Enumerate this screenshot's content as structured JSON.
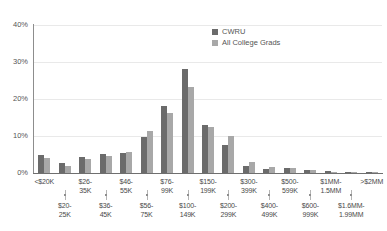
{
  "chart_data": {
    "type": "bar",
    "title": "",
    "subtitle": "",
    "xlabel": "",
    "ylabel": "",
    "ylim": [
      0,
      40
    ],
    "yticks": [
      0,
      10,
      20,
      30,
      40
    ],
    "ytick_labels": [
      "0%",
      "10%",
      "20%",
      "30%",
      "40%"
    ],
    "grid": true,
    "legend_position": "top-right",
    "value_unit": "%",
    "categories": [
      "<$20K",
      "$20-25K",
      "$26-35K",
      "$36-45K",
      "$46-55K",
      "$56-75K",
      "$76-99K",
      "$100-149K",
      "$150-199K",
      "$200-299K",
      "$300-399K",
      "$400-499K",
      "$500-599K",
      "$600-999K",
      "$1MM-1.5MM",
      "$1.6MM-1.99MM",
      ">$2MM"
    ],
    "series": [
      {
        "name": "CWRU",
        "color": "#6b6b6b",
        "values": [
          5.0,
          2.6,
          4.3,
          5.2,
          5.3,
          9.8,
          18.1,
          28.0,
          13.0,
          7.6,
          2.0,
          1.1,
          1.4,
          0.7,
          0.5,
          0.2,
          0.2
        ]
      },
      {
        "name": "All College Grads",
        "color": "#a8a8a8",
        "values": [
          4.1,
          2.0,
          3.8,
          4.5,
          5.6,
          11.3,
          16.3,
          23.2,
          12.4,
          10.0,
          2.9,
          1.6,
          1.3,
          0.9,
          0.4,
          0.3,
          0.2
        ]
      }
    ]
  },
  "legend": {
    "items": [
      {
        "label": "CWRU",
        "color": "#6b6b6b"
      },
      {
        "label": "All College Grads",
        "color": "#a8a8a8"
      }
    ]
  },
  "axis": {
    "y": {
      "ticks": [
        "40%",
        "30%",
        "20%",
        "10%",
        "0%"
      ]
    },
    "x": {
      "top_row": [
        "<$20K",
        "$26-35K",
        "$46-55K",
        "$76-99K",
        "$150-199K",
        "$300-399K",
        "$500-599K",
        "$1MM-1.5MM",
        ">$2MM"
      ],
      "bottom_row": [
        "$20-25K",
        "$36-45K",
        "$56-75K",
        "$100-149K",
        "$200-299K",
        "$400-499K",
        "$600-999K",
        "$1.6MM-1.99MM"
      ]
    }
  },
  "colors": {
    "series_primary": "#6b6b6b",
    "series_secondary": "#a8a8a8",
    "gridline": "#e9e9e9",
    "axis": "#6f6f6f",
    "text": "#4a4a4a",
    "background": "#ffffff"
  }
}
